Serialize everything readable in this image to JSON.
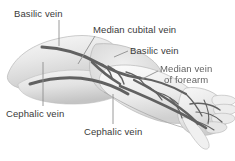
{
  "figure": {
    "kind": "anatomical-illustration",
    "style": "grayscale pencil shaded drawing",
    "colors": {
      "background": "#ffffff",
      "label_text": "#3a3a3a",
      "leader_line": "#8a8a8a",
      "vein": "#5f5f5f",
      "skin_light": "#f2f2f2",
      "skin_mid": "#dcdcdc",
      "skin_shadow": "#c2c2c2",
      "outline": "#9a9a9a"
    }
  },
  "labels": [
    {
      "id": "basilic-upper",
      "text": "Basilic vein",
      "position": "top-left",
      "leader": "vertical line down to vein on upper arm"
    },
    {
      "id": "median-cubital",
      "text": "Median cubital vein",
      "position": "top-center",
      "leader": "diagonal line down-left to cubital fossa"
    },
    {
      "id": "basilic-lower",
      "text": "Basilic vein",
      "position": "right-upper",
      "leader": "short diagonal line down-left"
    },
    {
      "id": "median-forearm",
      "text_line1": "Median vein",
      "text_line2": "of forearm",
      "position": "right",
      "leader": "diagonal line down-left to forearm vein",
      "render_note": "low-resolution blurred text"
    },
    {
      "id": "cephalic-upper",
      "text": "Cephalic vein",
      "position": "bottom-left",
      "leader": "vertical line up to vein on upper arm"
    },
    {
      "id": "cephalic-lower",
      "text": "Cephalic vein",
      "position": "bottom-center",
      "leader": "vertical line up to forearm vein"
    }
  ],
  "icons": {
    "leader_line": "leader-line-icon",
    "arm": "arm-illustration-icon"
  }
}
